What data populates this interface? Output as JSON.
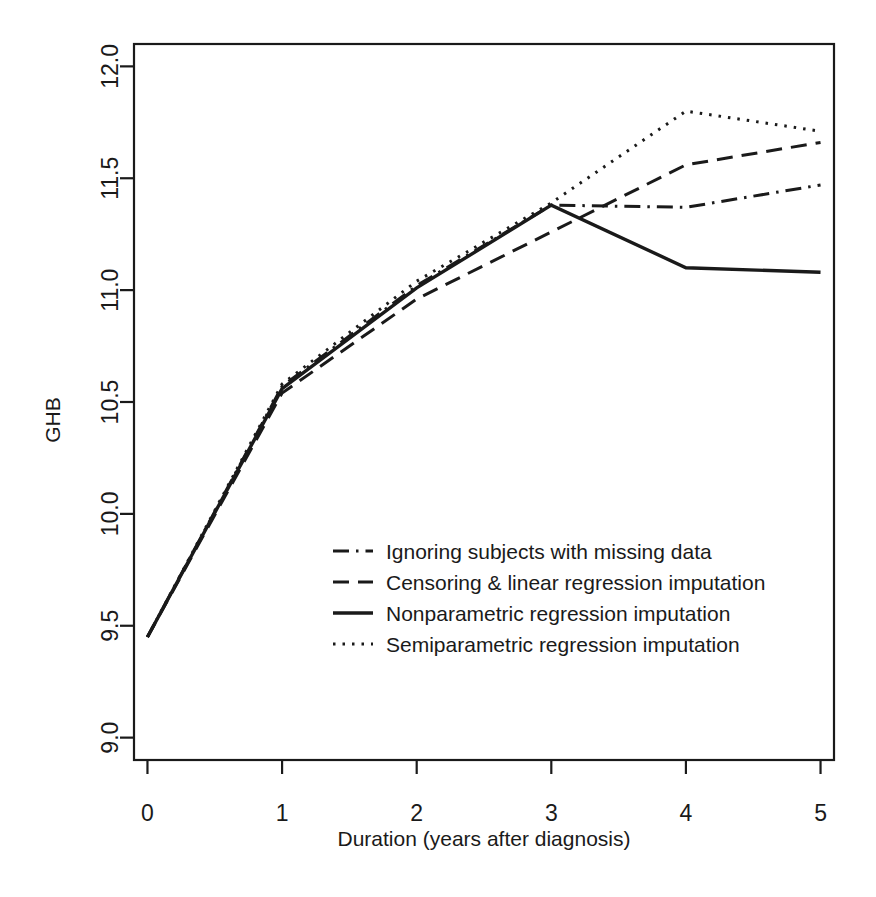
{
  "chart_data": {
    "type": "line",
    "title": "",
    "xlabel": "Duration (years after diagnosis)",
    "ylabel": "GHB",
    "xlim": [
      -0.1,
      5.1
    ],
    "ylim": [
      8.9,
      12.1
    ],
    "xticks": [
      0,
      1,
      2,
      3,
      4,
      5
    ],
    "xticklabels": [
      "0",
      "1",
      "2",
      "3",
      "4",
      "5"
    ],
    "yticks": [
      9.0,
      9.5,
      10.0,
      10.5,
      11.0,
      11.5,
      12.0
    ],
    "yticklabels": [
      "9.0",
      "9.5",
      "10.0",
      "10.5",
      "11.0",
      "11.5",
      "12.0"
    ],
    "grid": false,
    "legend_position": "center",
    "x": [
      0,
      1,
      2,
      3,
      4,
      5
    ],
    "series": [
      {
        "name": "Ignoring subjects with missing data",
        "style": "dash-dot",
        "color": "#1a1a1a",
        "values": [
          9.45,
          10.57,
          11.02,
          11.38,
          11.37,
          11.47
        ]
      },
      {
        "name": "Censoring & linear regression imputation",
        "style": "dashed",
        "color": "#1a1a1a",
        "values": [
          9.45,
          10.54,
          10.96,
          11.26,
          11.56,
          11.66
        ]
      },
      {
        "name": "Nonparametric regression imputation",
        "style": "solid",
        "color": "#1a1a1a",
        "values": [
          9.45,
          10.56,
          11.01,
          11.38,
          11.1,
          11.08
        ]
      },
      {
        "name": "Semiparametric regression imputation",
        "style": "dotted",
        "color": "#1a1a1a",
        "values": [
          9.45,
          10.58,
          11.04,
          11.39,
          11.8,
          11.71
        ]
      }
    ]
  },
  "axes": {
    "y_title": "GHB",
    "x_title": "Duration (years after diagnosis)"
  },
  "legend": {
    "items": [
      {
        "label": "Ignoring subjects with missing data",
        "style": "dash-dot"
      },
      {
        "label": "Censoring & linear regression imputation",
        "style": "dashed"
      },
      {
        "label": "Nonparametric regression imputation",
        "style": "solid"
      },
      {
        "label": "Semiparametric regression imputation",
        "style": "dotted"
      }
    ]
  }
}
